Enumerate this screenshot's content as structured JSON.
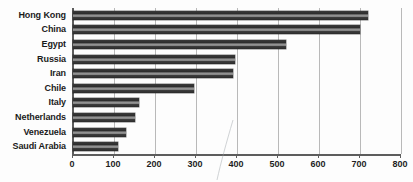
{
  "chart_data": {
    "type": "bar",
    "orientation": "horizontal",
    "title": "",
    "xlabel": "",
    "ylabel": "",
    "categories": [
      "Hong Kong",
      "China",
      "Egypt",
      "Russia",
      "Iran",
      "Chile",
      "Italy",
      "Netherlands",
      "Venezuela",
      "Saudi Arabia"
    ],
    "values": [
      720,
      700,
      520,
      395,
      390,
      295,
      160,
      150,
      130,
      110
    ],
    "xlim": [
      0,
      800
    ],
    "xticks": [
      0,
      100,
      200,
      300,
      400,
      500,
      600,
      700,
      800
    ],
    "xtick_labels": [
      "0",
      "100",
      "200",
      "300",
      "400",
      "500",
      "600",
      "700",
      "800"
    ],
    "grid": true,
    "grid_axis": "x",
    "legend": false,
    "bar_color": "#2e2e2e",
    "gridline_color": "#b9b9b9",
    "axis_color": "#5d5d5d",
    "label_color": "#1b1b1b"
  }
}
